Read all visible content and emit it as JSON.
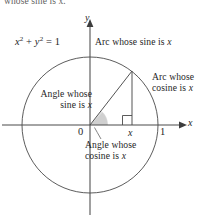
{
  "figure": {
    "width": 204,
    "height": 222,
    "background_color": "#ffffff",
    "line_color": "#3d3d3d",
    "shade_color": "#c9c9c9",
    "text_color": "#1f1f1f"
  },
  "cutoff_text": "whose sine is x.",
  "equation": {
    "base": "x",
    "exponent1": "2",
    "plus": " + ",
    "var2": "y",
    "exponent2": "2",
    "equals": " = 1"
  },
  "axes": {
    "y_label": "y",
    "x_label": "x",
    "origin_x": 90,
    "origin_y": 125,
    "radius": 68
  },
  "ticks": {
    "zero": "0",
    "x_point": "x",
    "one": "1"
  },
  "callouts": {
    "arc_sine": "Arc whose sine is x",
    "arc_cosine": "Arc whose\ncosine is x",
    "angle_sine": "Angle whose\nsine is x",
    "angle_cosine": "Angle whose\ncosine is x"
  },
  "chart_data": {
    "type": "diagram",
    "circle": {
      "center": [
        90,
        125
      ],
      "radius": 68,
      "equation": "x^2 + y^2 = 1"
    },
    "point_on_circle": [
      132,
      70
    ],
    "triangle_vertices": [
      [
        90,
        125
      ],
      [
        132,
        70
      ],
      [
        132,
        125
      ]
    ],
    "right_angle_marker_at": [
      132,
      125
    ],
    "axis_x_range": [
      -1,
      1
    ],
    "axis_y_range": [
      -1,
      1
    ],
    "labeled_points": [
      {
        "label": "0",
        "value": 0
      },
      {
        "label": "x",
        "value": 0.62
      },
      {
        "label": "1",
        "value": 1
      }
    ],
    "annotations": [
      "Arc whose sine is x",
      "Arc whose cosine is x",
      "Angle whose sine is x",
      "Angle whose cosine is x",
      "x^2 + y^2 = 1"
    ]
  }
}
